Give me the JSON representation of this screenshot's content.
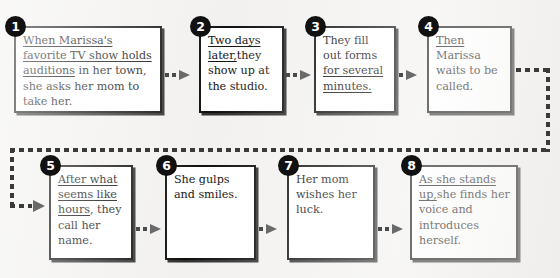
{
  "diagram": {
    "background_color": "#f2f1ef",
    "box_fill": "#ffffff",
    "box_border_color": "#101010",
    "badge_color": "#111111",
    "badge_text_color": "#ffffff",
    "connector_color": "#6a6a6a"
  },
  "steps": [
    {
      "number": "1",
      "text_plain": "When Marissa's favorite TV show holds auditions in her town, she asks her mom to take her.",
      "underlined": "When Marissa's favorite TV show holds auditions",
      "rest": " in her town, she asks her mom to take her."
    },
    {
      "number": "2",
      "text_plain": "Two days later, they show up at the studio.",
      "underlined": "Two days later,",
      "rest": "they show up at the studio."
    },
    {
      "number": "3",
      "text_plain": "They fill out forms for several minutes.",
      "leading": "They fill out forms ",
      "underlined": "for several minutes."
    },
    {
      "number": "4",
      "text_plain": "Then Marissa waits to be called.",
      "underlined": "Then",
      "rest": " Marissa waits to be called."
    },
    {
      "number": "5",
      "text_plain": "After what seems like hours, they call her name.",
      "underlined": "After what seems like hours",
      "rest": ", they call her name."
    },
    {
      "number": "6",
      "text_plain": "She gulps and smiles.",
      "underlined": "",
      "rest": "She gulps and smiles."
    },
    {
      "number": "7",
      "text_plain": "Her mom wishes her luck.",
      "underlined": "",
      "rest": "Her mom wishes her luck."
    },
    {
      "number": "8",
      "text_plain": "As she stands up, she finds her voice and introduces herself.",
      "underlined": "As she stands up,",
      "rest": "she finds her voice and introduces herself."
    }
  ],
  "connectors": [
    {
      "from": "1",
      "to": "2",
      "style": "dotted-arrow"
    },
    {
      "from": "2",
      "to": "3",
      "style": "dotted-arrow"
    },
    {
      "from": "3",
      "to": "4",
      "style": "dotted-arrow"
    },
    {
      "from": "4",
      "to": "5",
      "style": "dotted-wraparound-arrow"
    },
    {
      "from": "5",
      "to": "6",
      "style": "dotted-arrow"
    },
    {
      "from": "6",
      "to": "7",
      "style": "dotted-arrow"
    },
    {
      "from": "7",
      "to": "8",
      "style": "dotted-arrow"
    }
  ]
}
